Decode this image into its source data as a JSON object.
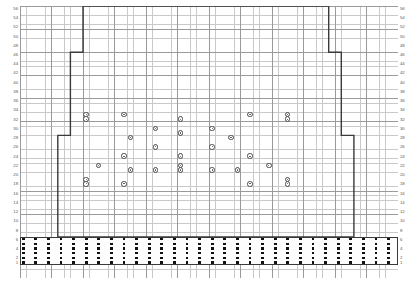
{
  "chart_data": {
    "type": "heatmap",
    "title": "",
    "xlabel": "",
    "ylabel": "",
    "grid": true,
    "legend_position": "none",
    "columns": 60,
    "rows": 56,
    "cell_width_px": 6.3,
    "cell_height_px": 4.62,
    "major_grid_every": 5,
    "row_labels_left": [
      "56",
      "55",
      "54",
      "53",
      "52",
      "51",
      "50",
      "49",
      "48",
      "47",
      "46",
      "45",
      "44",
      "43",
      "42",
      "41",
      "40",
      "39",
      "38",
      "37",
      "36",
      "35",
      "34",
      "33",
      "32",
      "31",
      "30",
      "29",
      "28",
      "27",
      "26",
      "25",
      "24",
      "23",
      "22",
      "21",
      "20",
      "19",
      "18",
      "17",
      "16",
      "15",
      "14",
      "13",
      "12",
      "11",
      "10",
      "9",
      "8",
      "7",
      "6",
      "5",
      "4",
      "3",
      "2",
      "1"
    ],
    "row_labels_right": [
      "56",
      "55",
      "54",
      "53",
      "52",
      "51",
      "50",
      "49",
      "48",
      "47",
      "46",
      "45",
      "44",
      "43",
      "42",
      "41",
      "40",
      "39",
      "38",
      "37",
      "36",
      "35",
      "34",
      "33",
      "32",
      "31",
      "30",
      "29",
      "28",
      "27",
      "26",
      "25",
      "24",
      "23",
      "22",
      "21",
      "20",
      "19",
      "18",
      "17",
      "16",
      "15",
      "14",
      "13",
      "12",
      "11",
      "10",
      "9",
      "8",
      "7",
      "6",
      "5",
      "4",
      "3",
      "2",
      "1"
    ],
    "symbol_legend": [
      {
        "name": "circle-symbol",
        "meaning": "patterned stitch",
        "color": "#4a4a4a"
      },
      {
        "name": "square-dot-symbol",
        "meaning": "purl stitch",
        "color": "#111111"
      }
    ],
    "outline_color": "#3a3a3a",
    "grid_minor_color": "#c9c9c9",
    "grid_major_color": "#9a9a9a",
    "outline_steps": [
      {
        "row_from": 56,
        "row_to": 47,
        "col_start": 11,
        "col_end": 49
      },
      {
        "row_from": 46,
        "row_to": 29,
        "col_start": 9,
        "col_end": 51
      },
      {
        "row_from": 28,
        "row_to": 7,
        "col_start": 7,
        "col_end": 53
      }
    ],
    "bottom_band": {
      "rows": [
        1,
        2,
        3,
        4,
        5,
        6
      ],
      "symbol": "square-dot-symbol",
      "column_step": 2,
      "col_start": 1,
      "col_end": 59
    },
    "motif": {
      "name": "diamond-argyle-motif",
      "symbol": "circle-symbol",
      "cells": [
        {
          "row": 33,
          "col": 11
        },
        {
          "row": 33,
          "col": 17
        },
        {
          "row": 33,
          "col": 37
        },
        {
          "row": 33,
          "col": 43
        },
        {
          "row": 32,
          "col": 11
        },
        {
          "row": 32,
          "col": 26
        },
        {
          "row": 32,
          "col": 43
        },
        {
          "row": 30,
          "col": 22
        },
        {
          "row": 30,
          "col": 31
        },
        {
          "row": 29,
          "col": 26
        },
        {
          "row": 28,
          "col": 18
        },
        {
          "row": 28,
          "col": 34
        },
        {
          "row": 26,
          "col": 22
        },
        {
          "row": 26,
          "col": 31
        },
        {
          "row": 24,
          "col": 17
        },
        {
          "row": 24,
          "col": 26
        },
        {
          "row": 24,
          "col": 37
        },
        {
          "row": 22,
          "col": 13
        },
        {
          "row": 22,
          "col": 26
        },
        {
          "row": 22,
          "col": 40
        },
        {
          "row": 21,
          "col": 18
        },
        {
          "row": 21,
          "col": 22
        },
        {
          "row": 21,
          "col": 26
        },
        {
          "row": 21,
          "col": 31
        },
        {
          "row": 21,
          "col": 35
        },
        {
          "row": 19,
          "col": 11
        },
        {
          "row": 19,
          "col": 43
        },
        {
          "row": 18,
          "col": 11
        },
        {
          "row": 18,
          "col": 17
        },
        {
          "row": 18,
          "col": 37
        },
        {
          "row": 18,
          "col": 43
        }
      ]
    }
  }
}
